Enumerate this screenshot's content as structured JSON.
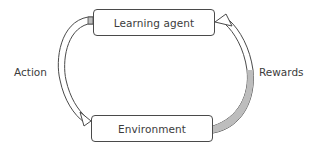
{
  "diagram": {
    "type": "cycle",
    "nodes": [
      {
        "id": "agent",
        "label": "Learning agent"
      },
      {
        "id": "environment",
        "label": "Environment"
      }
    ],
    "edges": [
      {
        "from": "agent",
        "to": "environment",
        "label": "Action",
        "side": "left"
      },
      {
        "from": "environment",
        "to": "agent",
        "label": "Rewards",
        "side": "right"
      }
    ],
    "colors": {
      "stroke": "#4a4a4a",
      "arrow_fill": "#bdbdbd",
      "text": "#3c3c3c",
      "background": "#ffffff"
    }
  }
}
